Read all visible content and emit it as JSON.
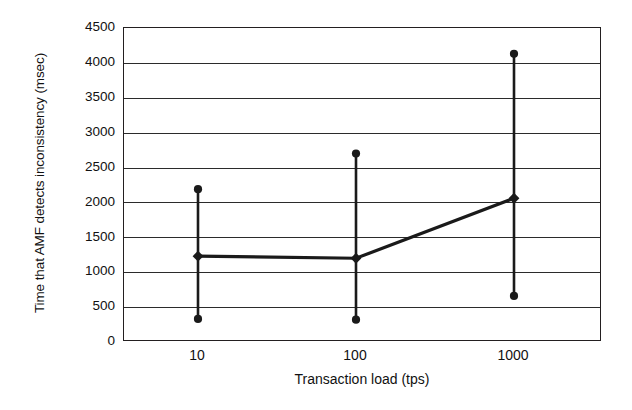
{
  "chart_data": {
    "type": "line",
    "title": "",
    "xlabel": "Transaction load (tps)",
    "ylabel": "Time that AMF detects inconsistency (msec)",
    "xscale": "log",
    "categories": [
      "10",
      "100",
      "1000"
    ],
    "x": [
      10,
      100,
      1000
    ],
    "xticklabels": [
      "10",
      "100",
      "1000"
    ],
    "yticklabels": [
      "0",
      "500",
      "1000",
      "1500",
      "2000",
      "2500",
      "3000",
      "3500",
      "4000",
      "4500"
    ],
    "yticks": [
      0,
      500,
      1000,
      1500,
      2000,
      2500,
      3000,
      3500,
      4000,
      4500
    ],
    "ylim": [
      0,
      4500
    ],
    "grid": "horizontal",
    "legend": "none",
    "series": [
      {
        "name": "Time that AMF detects inconsistency (msec)",
        "values": [
          1230,
          1200,
          2060
        ],
        "err_low": [
          330,
          320,
          660
        ],
        "err_high": [
          2190,
          2700,
          4130
        ],
        "marker": "filled-diamond",
        "color": "#1a1a1a"
      }
    ],
    "points": [
      {
        "x": "10",
        "mean": 1230,
        "min": 330,
        "max": 2190
      },
      {
        "x": "100",
        "mean": 1200,
        "min": 320,
        "max": 2700
      },
      {
        "x": "1000",
        "mean": 2060,
        "min": 660,
        "max": 4130
      }
    ]
  },
  "colors": {
    "axis": "#231f20",
    "grid": "#2b2b2b",
    "series": "#1a1a1a",
    "background": "#ffffff"
  }
}
